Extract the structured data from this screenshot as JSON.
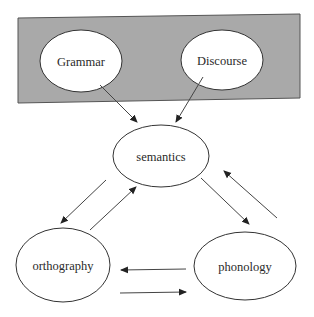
{
  "diagram": {
    "group_box": {
      "fill": "#a9a9a9",
      "stroke": "#555555"
    },
    "nodes": {
      "grammar": {
        "label": "Grammar"
      },
      "discourse": {
        "label": "Discourse"
      },
      "semantics": {
        "label": "semantics"
      },
      "orthography": {
        "label": "orthography"
      },
      "phonology": {
        "label": "phonology"
      }
    },
    "edges": [
      {
        "from": "Grammar",
        "to": "semantics"
      },
      {
        "from": "Discourse",
        "to": "semantics"
      },
      {
        "from": "semantics",
        "to": "orthography"
      },
      {
        "from": "orthography",
        "to": "semantics"
      },
      {
        "from": "semantics",
        "to": "phonology"
      },
      {
        "from": "phonology",
        "to": "semantics"
      },
      {
        "from": "phonology",
        "to": "orthography"
      },
      {
        "from": "orthography",
        "to": "phonology"
      }
    ],
    "colors": {
      "line": "#444444",
      "node_fill": "#ffffff",
      "text": "#2a2a2a"
    }
  }
}
